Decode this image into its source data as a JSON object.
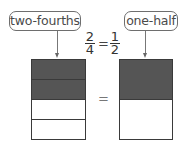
{
  "labels": {
    "left": "two-fourths",
    "right": "one-half"
  },
  "equation": {
    "left_fraction": {
      "numerator": "2",
      "denominator": "4"
    },
    "equals": "=",
    "right_fraction": {
      "numerator": "1",
      "denominator": "2"
    }
  },
  "between_bars_equals": "=",
  "models": [
    {
      "name": "two-fourths",
      "parts": 4,
      "shaded": 2
    },
    {
      "name": "one-half",
      "parts": 2,
      "shaded": 1
    }
  ],
  "colors": {
    "shaded": "#555555",
    "outline": "#3a3a3a",
    "label_border": "#6e6e6e",
    "text": "#4a4a4a"
  }
}
